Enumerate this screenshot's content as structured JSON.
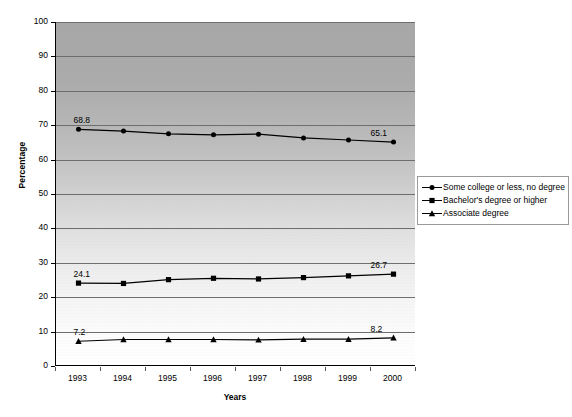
{
  "chart_data": {
    "type": "line",
    "title": "",
    "xlabel": "Years",
    "ylabel": "Percentage",
    "categories": [
      "1993",
      "1994",
      "1995",
      "1996",
      "1997",
      "1998",
      "1999",
      "2000"
    ],
    "ylim": [
      0,
      100
    ],
    "y_ticks": [
      "0",
      "10",
      "20",
      "30",
      "40",
      "50",
      "60",
      "70",
      "80",
      "90",
      "100"
    ],
    "grid": true,
    "legend_position": "right",
    "series": [
      {
        "name": "Some college or less, no degree",
        "marker": "diamond",
        "values": [
          68.8,
          68.3,
          67.5,
          67.2,
          67.4,
          66.3,
          65.7,
          65.1
        ],
        "labels": [
          {
            "index": 0,
            "text": "68.8"
          },
          {
            "index": 7,
            "text": "65.1"
          }
        ]
      },
      {
        "name": "Bachelor's degree or higher",
        "marker": "square",
        "values": [
          24.1,
          24.0,
          25.1,
          25.5,
          25.3,
          25.7,
          26.2,
          26.7
        ],
        "labels": [
          {
            "index": 0,
            "text": "24.1"
          },
          {
            "index": 7,
            "text": "26.7"
          }
        ]
      },
      {
        "name": "Associate degree",
        "marker": "triangle",
        "values": [
          7.2,
          7.7,
          7.7,
          7.7,
          7.6,
          7.8,
          7.8,
          8.2
        ],
        "labels": [
          {
            "index": 0,
            "text": "7.2"
          },
          {
            "index": 7,
            "text": "8.2"
          }
        ]
      }
    ],
    "colors": {
      "line": "#000000",
      "gridline": "#6e6e6e",
      "plot_top": "#a8a8a8",
      "plot_bottom": "#ffffff",
      "legend_border": "#9a9a9a"
    }
  }
}
